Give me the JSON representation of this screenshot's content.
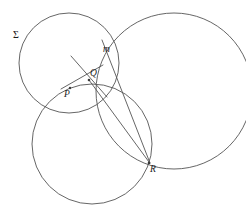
{
  "figure": {
    "canvas": {
      "width": 246,
      "height": 213,
      "background": "#ffffff"
    },
    "stroke_color": "#555555",
    "label_color": "#1a1a1a",
    "labels": [
      {
        "id": "sigma",
        "text": "Σ",
        "x": 13,
        "y": 38,
        "style": "upright",
        "describes": "large-left-circle"
      },
      {
        "id": "m",
        "text": "m",
        "x": 103,
        "y": 52,
        "style": "italic",
        "describes": "line-m"
      },
      {
        "id": "Q",
        "text": "Q",
        "x": 90,
        "y": 76,
        "style": "italic",
        "describes": "point-Q"
      },
      {
        "id": "P",
        "text": "P",
        "x": 64,
        "y": 97,
        "style": "italic",
        "describes": "point-P"
      },
      {
        "id": "R",
        "text": "R",
        "x": 150,
        "y": 172,
        "style": "italic",
        "describes": "point-R"
      }
    ],
    "circles": [
      {
        "id": "sigma-circle",
        "name": "circle-sigma-upper-left",
        "cx": 69,
        "cy": 63,
        "r": 50
      },
      {
        "id": "right-circle",
        "name": "circle-right",
        "cx": 174,
        "cy": 91,
        "r": 78
      },
      {
        "id": "bottom-circle",
        "name": "circle-bottom-left",
        "cx": 92,
        "cy": 144,
        "r": 60
      }
    ],
    "lines": [
      {
        "id": "line-m",
        "name": "line-m-through-Q-to-R",
        "x1": 102,
        "y1": 40,
        "x2": 150,
        "y2": 163
      },
      {
        "id": "chord-QR",
        "name": "chord-Q-to-R",
        "x1": 89,
        "y1": 80,
        "x2": 149,
        "y2": 162
      },
      {
        "id": "segment-cross",
        "name": "segment-through-P-Q",
        "x1": 71,
        "y1": 56,
        "x2": 107,
        "y2": 97
      },
      {
        "id": "segment-PQ",
        "name": "segment-P-to-Q",
        "x1": 61,
        "y1": 89,
        "x2": 103,
        "y2": 65
      }
    ],
    "points": [
      {
        "id": "pt-P",
        "name": "point-P",
        "cx": 70,
        "cy": 88,
        "r": 1.2
      },
      {
        "id": "pt-Q",
        "name": "point-Q",
        "cx": 89,
        "cy": 80,
        "r": 1.3
      },
      {
        "id": "pt-R",
        "name": "point-R",
        "cx": 149,
        "cy": 163,
        "r": 1.3
      }
    ]
  }
}
